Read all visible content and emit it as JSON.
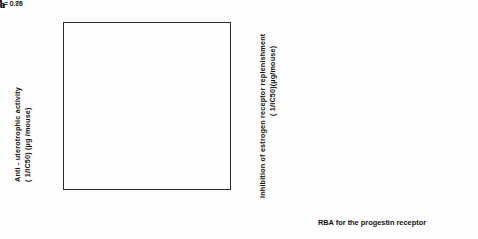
{
  "figure": {
    "xlabel": "RBA for the progestin receptor",
    "panels": [
      {
        "letter": "a",
        "ylabel_line1": "Anti - uterotrophic  activity",
        "ylabel_line2": "( 1/IC50) (µg /mouse)",
        "r_text": "r = 0.79"
      },
      {
        "letter": "b",
        "ylabel_line1": "Inhibition  of  estrogen  receptor  replenishment",
        "ylabel_line2": "( 1/IC50)(µg/mouse)",
        "r_text": "r = 0.86"
      }
    ]
  },
  "chart_data": [
    {
      "type": "scatter",
      "panel": "a",
      "title": "",
      "xlabel": "RBA for the progestin receptor",
      "ylabel": "Anti - uterotrophic activity (1/IC50) (µg/mouse)",
      "xscale": "log",
      "yscale": "log",
      "xlim": [
        1,
        2000
      ],
      "ylim": [
        0.001,
        1.4
      ],
      "xticks": [
        1,
        10,
        100,
        1000
      ],
      "xticklabels": [
        "1",
        "10",
        "100",
        "1000"
      ],
      "yticks": [
        1,
        0.1,
        0.01,
        0.001
      ],
      "yticklabels": [
        "1",
        "0.1",
        "0.01",
        "0.001"
      ],
      "grid": false,
      "legend": "none",
      "annotations": [
        {
          "text": "r = 0.79",
          "x": 4.5,
          "y": 0.008,
          "rotation": 27
        }
      ],
      "fit_line": {
        "x": [
          1.1,
          1900
        ],
        "y": [
          0.0031,
          0.33
        ]
      },
      "points": [
        {
          "id": "12",
          "x": 160,
          "y": 1.0,
          "marker": "star"
        },
        {
          "id": "8",
          "x": 260,
          "y": 1.0,
          "marker": "star"
        },
        {
          "id": "30",
          "x": 1.8,
          "y": 0.3,
          "marker": "star"
        },
        {
          "id": "28",
          "x": 2.9,
          "y": 0.3,
          "marker": "star"
        },
        {
          "id": "11",
          "x": 300,
          "y": 0.3,
          "marker": "star"
        },
        {
          "id": "6",
          "x": 360,
          "y": 0.3,
          "marker": "filled"
        },
        {
          "id": "2",
          "x": 1050,
          "y": 0.3,
          "marker": "filled"
        },
        {
          "id": "5",
          "x": 420,
          "y": 0.17,
          "marker": "filled"
        },
        {
          "id": "23",
          "x": 13,
          "y": 0.1,
          "marker": "star"
        },
        {
          "id": "21",
          "x": 48,
          "y": 0.1,
          "marker": "open"
        },
        {
          "id": "20",
          "x": 58,
          "y": 0.1,
          "marker": "filled"
        },
        {
          "id": "17",
          "x": 95,
          "y": 0.1,
          "marker": "filled"
        },
        {
          "id": "13",
          "x": 160,
          "y": 0.12,
          "marker": "filled"
        },
        {
          "id": "7",
          "x": 330,
          "y": 0.1,
          "marker": "filled"
        },
        {
          "id": "4",
          "x": 480,
          "y": 0.12,
          "marker": "filled"
        },
        {
          "id": "1",
          "x": 1150,
          "y": 0.095,
          "marker": "open"
        },
        {
          "id": "15",
          "x": 230,
          "y": 0.095,
          "marker": "open"
        },
        {
          "id": "27",
          "x": 12,
          "y": 0.05,
          "marker": "filled"
        },
        {
          "id": "24",
          "x": 15,
          "y": 0.05,
          "marker": "star"
        },
        {
          "id": "16",
          "x": 75,
          "y": 0.05,
          "marker": "open"
        },
        {
          "id": "14",
          "x": 175,
          "y": 0.05,
          "marker": "filled"
        },
        {
          "id": "26",
          "x": 270,
          "y": 0.02,
          "marker": "open"
        },
        {
          "id": "29",
          "x": 38,
          "y": 0.01,
          "marker": "filled"
        },
        {
          "id": "22",
          "x": 100,
          "y": 0.01,
          "marker": "open"
        },
        {
          "id": "18",
          "x": 175,
          "y": 0.01,
          "marker": "filled"
        },
        {
          "id": "9",
          "x": 430,
          "y": 0.0095,
          "marker": "open"
        },
        {
          "id": "10",
          "x": 430,
          "y": 0.0078,
          "marker": "open"
        },
        {
          "id": "19",
          "x": 40,
          "y": 0.005,
          "marker": "filled"
        },
        {
          "id": "33",
          "x": 1.05,
          "y": 0.005,
          "marker": "filled"
        },
        {
          "id": "32",
          "x": 1.45,
          "y": 0.005,
          "marker": "filled"
        },
        {
          "id": "31",
          "x": 1.35,
          "y": 0.0042,
          "marker": "filled"
        },
        {
          "id": "25",
          "x": 2.9,
          "y": 0.0042,
          "marker": "star"
        }
      ]
    },
    {
      "type": "scatter",
      "panel": "b",
      "title": "",
      "xlabel": "RBA for the progestin receptor",
      "ylabel": "Inhibition of estrogen receptor replenishment (1/IC50)(µg/mouse)",
      "xscale": "log",
      "yscale": "log",
      "xlim": [
        1,
        2000
      ],
      "ylim": [
        0.0008,
        2.0
      ],
      "xticks": [
        1,
        10,
        100,
        1000
      ],
      "xticklabels": [
        "1",
        "10",
        "100",
        "1000"
      ],
      "yticks": [
        1,
        0.1,
        0.01,
        0.001
      ],
      "yticklabels": [
        "",
        "",
        "",
        ""
      ],
      "grid": false,
      "legend": "none",
      "annotations": [
        {
          "text": "r = 0.86",
          "x": 3.6,
          "y": 0.0035,
          "rotation": 33
        }
      ],
      "fit_line": {
        "x": [
          1.05,
          1500
        ],
        "y": [
          0.0016,
          0.62
        ]
      },
      "points": [
        {
          "id": "8",
          "x": 300,
          "y": 0.72,
          "marker": "star"
        },
        {
          "id": "2",
          "x": 900,
          "y": 0.8,
          "marker": "filled"
        },
        {
          "id": "26",
          "x": 2.6,
          "y": 0.62,
          "marker": "star"
        },
        {
          "id": "23",
          "x": 14,
          "y": 0.62,
          "marker": "star"
        },
        {
          "id": "11",
          "x": 190,
          "y": 0.52,
          "marker": "star"
        },
        {
          "id": "6",
          "x": 330,
          "y": 0.55,
          "marker": "filled"
        },
        {
          "id": "5",
          "x": 420,
          "y": 0.55,
          "marker": "filled"
        },
        {
          "id": "4",
          "x": 580,
          "y": 0.33,
          "marker": "filled"
        },
        {
          "id": "17",
          "x": 95,
          "y": 0.22,
          "marker": "filled"
        },
        {
          "id": "13",
          "x": 150,
          "y": 0.23,
          "marker": "filled"
        },
        {
          "id": "3",
          "x": 900,
          "y": 0.15,
          "marker": "open"
        },
        {
          "id": "1",
          "x": 1150,
          "y": 0.15,
          "marker": "filled"
        },
        {
          "id": "30",
          "x": 1.5,
          "y": 0.13,
          "marker": "star"
        },
        {
          "id": "27",
          "x": 1.5,
          "y": 0.1,
          "marker": "star"
        },
        {
          "id": "14",
          "x": 185,
          "y": 0.115,
          "marker": "filled"
        },
        {
          "id": "9",
          "x": 290,
          "y": 0.14,
          "marker": "open"
        },
        {
          "id": "10",
          "x": 290,
          "y": 0.115,
          "marker": "open"
        },
        {
          "id": "12",
          "x": 290,
          "y": 0.095,
          "marker": "star"
        },
        {
          "id": "7",
          "x": 360,
          "y": 0.095,
          "marker": "filled"
        },
        {
          "id": "15",
          "x": 68,
          "y": 0.088,
          "marker": "filled"
        },
        {
          "id": "16",
          "x": 280,
          "y": 0.072,
          "marker": "open"
        },
        {
          "id": "24",
          "x": 14,
          "y": 0.062,
          "marker": "star"
        },
        {
          "id": "21",
          "x": 55,
          "y": 0.062,
          "marker": "open"
        },
        {
          "id": "20",
          "x": 62,
          "y": 0.062,
          "marker": "filled"
        },
        {
          "id": "28",
          "x": 2.6,
          "y": 0.022,
          "marker": "star"
        },
        {
          "id": "29",
          "x": 12,
          "y": 0.03,
          "marker": "filled"
        },
        {
          "id": "31",
          "x": 12,
          "y": 0.024,
          "marker": "filled"
        },
        {
          "id": "22",
          "x": 95,
          "y": 0.022,
          "marker": "open"
        },
        {
          "id": "18",
          "x": 160,
          "y": 0.021,
          "marker": "filled"
        },
        {
          "id": "32",
          "x": 1.5,
          "y": 0.0085,
          "marker": "star"
        },
        {
          "id": "19",
          "x": 40,
          "y": 0.012,
          "marker": "filled"
        },
        {
          "id": "33",
          "x": 1.05,
          "y": 0.0016,
          "marker": "filled"
        }
      ]
    }
  ]
}
